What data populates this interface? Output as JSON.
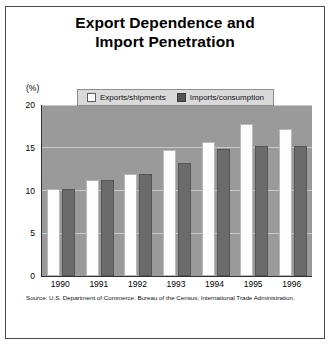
{
  "title": {
    "line1": "Export Dependence and",
    "line2": "Import Penetration"
  },
  "axis": {
    "unit_label": "(%)",
    "y_ticks": [
      "20",
      "15",
      "10",
      "5",
      "0"
    ]
  },
  "legend": {
    "items": [
      {
        "label": "Exports/shipments",
        "swatch": "white"
      },
      {
        "label": "Imports/consumption",
        "swatch": "dark"
      }
    ]
  },
  "source": "Source: U.S. Department of Commerce: Bureau of the Census; International Trade Administration.",
  "colors": {
    "plot_background": "#9a9a9a",
    "exports_bar": "#fdfdfd",
    "imports_bar": "#6b6b6b",
    "gridline": "#c9c9c9",
    "legend_background": "#d9d9d9",
    "frame_border": "#4a4a4a",
    "text": "#000000"
  },
  "chart_data": {
    "type": "bar",
    "title": "Export Dependence and Import Penetration",
    "xlabel": "",
    "ylabel": "(%)",
    "ylim": [
      0,
      20
    ],
    "yticks": [
      0,
      5,
      10,
      15,
      20
    ],
    "grid": true,
    "legend_position": "top-center",
    "categories": [
      "1990",
      "1991",
      "1992",
      "1993",
      "1994",
      "1995",
      "1996"
    ],
    "series": [
      {
        "name": "Exports/shipments",
        "values": [
          10.2,
          11.2,
          11.9,
          14.7,
          15.7,
          17.8,
          17.2
        ]
      },
      {
        "name": "Imports/consumption",
        "values": [
          10.2,
          11.2,
          11.9,
          13.2,
          14.9,
          15.2,
          15.2
        ]
      }
    ]
  }
}
